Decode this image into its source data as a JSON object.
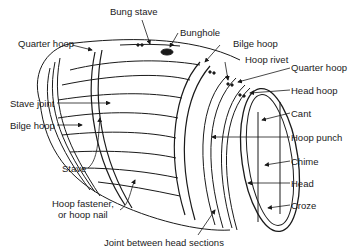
{
  "figure": {
    "labels": {
      "bung_stave": "Bung stave",
      "bunghole": "Bunghole",
      "quarter_hoop_left": "Quarter hoop",
      "bilge_hoop_top": "Bilge hoop",
      "hoop_rivet": "Hoop rivet",
      "quarter_hoop_right": "Quarter hoop",
      "head_hoop": "Head hoop",
      "cant": "Cant",
      "hoop_punch": "Hoop punch",
      "chime": "Chime",
      "head": "Head",
      "croze": "Croze",
      "stave_joint": "Stave joint",
      "bilge_hoop_left": "Bilge hoop",
      "stave": "Stave",
      "hoop_fastener_line1": "Hoop fastener,",
      "hoop_fastener_line2": "or hoop nail",
      "joint_between_head_sections": "Joint between head sections"
    },
    "colors": {
      "line": "#1a1a1a",
      "background": "#ffffff"
    }
  }
}
